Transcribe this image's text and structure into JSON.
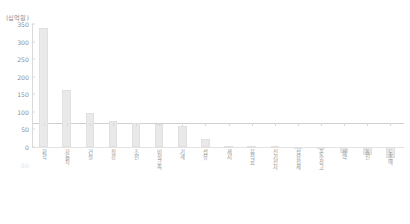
{
  "chart_data": {
    "type": "bar",
    "title": "",
    "subtitle": "",
    "xlabel": "",
    "ylabel": "",
    "unit_label": "(십억원)",
    "ylim": [
      -50,
      350
    ],
    "yticks": [
      350,
      300,
      250,
      200,
      150,
      100,
      50,
      0,
      -50
    ],
    "ytick_labels": [
      "350",
      "300",
      "250",
      "200",
      "150",
      "100",
      "50",
      "0",
      "-50"
    ],
    "grid": false,
    "legend": null,
    "bar_color": "#e9e9e9",
    "bar_border_color": "#e0e0e0",
    "axis_color": "#d9d9d9",
    "text_color": "#9a9a9a",
    "categories": [
      "화학",
      "자동차",
      "건설",
      "철강",
      "조선",
      "비철금속",
      "기계",
      "섬유",
      "제지",
      "음식료",
      "전기전자",
      "석유정제",
      "운수창고",
      "제약",
      "통신",
      "도소매"
    ],
    "category_labels": [
      "화학",
      "자동차",
      "건설",
      "철강",
      "조선",
      "비철금속",
      "기계",
      "섬유",
      "제지",
      "음식료",
      "전기전자",
      "석유정제",
      "운수창고",
      "제약",
      "통신",
      "도소매"
    ],
    "values": [
      338,
      161,
      96,
      73,
      68,
      66,
      61,
      24,
      3,
      2,
      1,
      -2,
      -5,
      -16,
      -24,
      -32
    ]
  }
}
